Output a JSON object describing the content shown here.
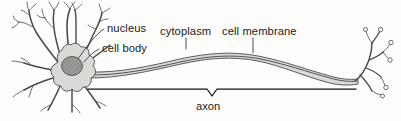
{
  "figure": {
    "background_color": "#fdfdfc",
    "width": 401,
    "height": 121
  },
  "colors": {
    "soma_fill": "#d9d9d6",
    "nucleus_fill": "#9a9a97",
    "axon_fill": "#d9d9d6",
    "outline": "#4a4a4a",
    "text": "#1b1b1b",
    "brace": "#111111"
  },
  "labels": {
    "nucleus": "nucleus",
    "cell_body": "cell body",
    "cytoplasm": "cytoplasm",
    "cell_membrane": "cell membrane",
    "axon": "axon"
  },
  "parts": {
    "dendrites": "dendrites",
    "soma": "cell-body-soma",
    "nucleus_shape": "nucleus",
    "axon_tube": "axon",
    "axon_terminals": "axon-terminals",
    "synaptic_boutons": "synaptic-boutons"
  }
}
